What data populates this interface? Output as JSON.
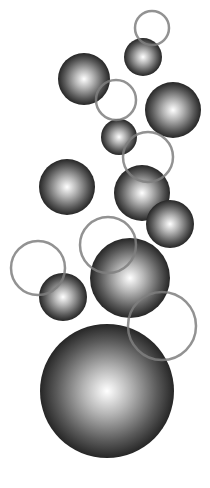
{
  "canvas": {
    "width": 210,
    "height": 488,
    "background": "#ffffff"
  },
  "colors": {
    "sphere_highlight": "#ffffff",
    "sphere_mid": "#9a9a9a",
    "sphere_edge": "#262626",
    "ring_stroke": "#7f7f7f"
  },
  "spheres": [
    {
      "cx": 143,
      "cy": 57,
      "r": 19
    },
    {
      "cx": 84,
      "cy": 79,
      "r": 26
    },
    {
      "cx": 173,
      "cy": 110,
      "r": 28
    },
    {
      "cx": 119,
      "cy": 137,
      "r": 18
    },
    {
      "cx": 67,
      "cy": 187,
      "r": 28
    },
    {
      "cx": 142,
      "cy": 193,
      "r": 28
    },
    {
      "cx": 170,
      "cy": 224,
      "r": 24
    },
    {
      "cx": 63,
      "cy": 297,
      "r": 24
    },
    {
      "cx": 130,
      "cy": 278,
      "r": 40
    },
    {
      "cx": 107,
      "cy": 391,
      "r": 67
    }
  ],
  "rings": [
    {
      "cx": 152,
      "cy": 28,
      "r": 17
    },
    {
      "cx": 116,
      "cy": 100,
      "r": 20
    },
    {
      "cx": 148,
      "cy": 157,
      "r": 25
    },
    {
      "cx": 108,
      "cy": 245,
      "r": 28
    },
    {
      "cx": 38,
      "cy": 268,
      "r": 27
    },
    {
      "cx": 162,
      "cy": 326,
      "r": 34
    }
  ]
}
